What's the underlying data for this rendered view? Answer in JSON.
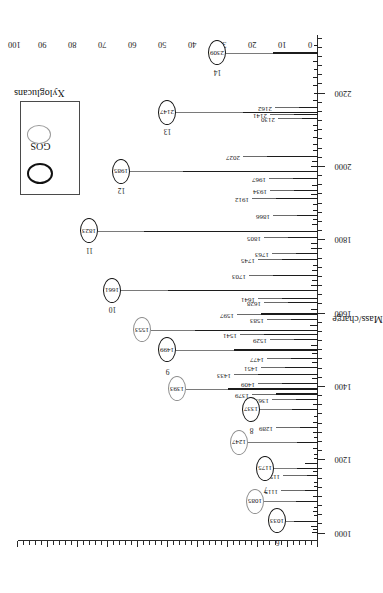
{
  "figure": {
    "orientation": "rotated-90",
    "background": "#ffffff"
  },
  "legend": {
    "position": "top-left",
    "items": [
      {
        "label": "GOS",
        "marker": "open-circle",
        "color": "#111111",
        "style": "thick-dark-ring"
      },
      {
        "label": "Xyloglucans",
        "marker": "open-circle",
        "color": "#9a9a9a",
        "style": "thin-grey-ring"
      }
    ]
  },
  "chart_data": {
    "type": "bar",
    "title": "",
    "subtitle": "",
    "xlabel": "Mass/charge",
    "ylabel": "",
    "xlim": [
      980,
      2360
    ],
    "ylim": [
      0,
      100
    ],
    "grid": false,
    "legend_position": "top-left",
    "xticks": [
      1000,
      1200,
      1400,
      1600,
      1800,
      2000,
      2200
    ],
    "xtick_labels": [
      "1000",
      "1200",
      "1400",
      "1600",
      "1800",
      "2000",
      "2200"
    ],
    "yticks": [
      0,
      10,
      20,
      30,
      40,
      50,
      60,
      70,
      80,
      90,
      100
    ],
    "ytick_labels": [
      "0",
      "10",
      "20",
      "30",
      "40",
      "50",
      "60",
      "70",
      "80",
      "90",
      "100"
    ],
    "x": [
      1001,
      1011,
      1019,
      1033,
      1047,
      1059,
      1071,
      1085,
      1099,
      1115,
      1127,
      1139,
      1157,
      1167,
      1175,
      1189,
      1203,
      1215,
      1231,
      1247,
      1261,
      1275,
      1289,
      1303,
      1319,
      1337,
      1351,
      1365,
      1379,
      1393,
      1409,
      1421,
      1433,
      1451,
      1465,
      1477,
      1489,
      1499,
      1513,
      1529,
      1541,
      1553,
      1565,
      1583,
      1597,
      1611,
      1628,
      1641,
      1661,
      1675,
      1689,
      1703,
      1717,
      1731,
      1745,
      1763,
      1777,
      1791,
      1805,
      1823,
      1841,
      1855,
      1866,
      1880,
      1896,
      1912,
      1924,
      1934,
      1948,
      1967,
      1985,
      2001,
      2013,
      2027,
      2043,
      2061,
      2079,
      2097,
      2113,
      2130,
      2141,
      2147,
      2162,
      2180,
      2199,
      2221,
      2243,
      2265,
      2287,
      2309,
      2331
    ],
    "values": [
      2.0,
      1.6,
      2.4,
      8.0,
      1.4,
      1.8,
      1.5,
      7.5,
      1.6,
      4.2,
      1.4,
      1.5,
      3.6,
      1.8,
      7.0,
      4.4,
      1.5,
      1.4,
      1.6,
      7.0,
      1.4,
      1.6,
      6.0,
      1.6,
      1.4,
      8.6,
      1.8,
      7.4,
      14.0,
      30.0,
      12.0,
      2.0,
      20.0,
      11.0,
      2.0,
      9.0,
      2.0,
      28.0,
      2.4,
      8.0,
      18.0,
      41.0,
      2.6,
      9.0,
      19.0,
      2.4,
      10.0,
      12.0,
      50.0,
      2.2,
      2.0,
      15.0,
      2.0,
      1.8,
      12.0,
      7.5,
      2.2,
      2.4,
      10.0,
      58.0,
      2.0,
      1.8,
      7.0,
      1.8,
      1.6,
      14.0,
      2.2,
      8.0,
      2.0,
      8.5,
      45.0,
      2.4,
      2.0,
      17.0,
      1.8,
      1.8,
      1.6,
      1.5,
      1.6,
      5.5,
      8.0,
      25.0,
      6.5,
      1.6,
      1.5,
      1.6,
      1.6,
      1.5,
      1.6,
      15.0,
      1.5
    ],
    "annotations_plain": [
      {
        "mz": 1115,
        "label": "1115"
      },
      {
        "mz": 1157,
        "label": "1157"
      },
      {
        "mz": 1289,
        "label": "1289"
      },
      {
        "mz": 1365,
        "label": "1365"
      },
      {
        "mz": 1379,
        "label": "1379"
      },
      {
        "mz": 1409,
        "label": "1409"
      },
      {
        "mz": 1433,
        "label": "1433"
      },
      {
        "mz": 1451,
        "label": "1451"
      },
      {
        "mz": 1477,
        "label": "1477"
      },
      {
        "mz": 1529,
        "label": "1529"
      },
      {
        "mz": 1541,
        "label": "1541"
      },
      {
        "mz": 1583,
        "label": "1583"
      },
      {
        "mz": 1597,
        "label": "1597"
      },
      {
        "mz": 1628,
        "label": "1628"
      },
      {
        "mz": 1641,
        "label": "1641"
      },
      {
        "mz": 1703,
        "label": "1703"
      },
      {
        "mz": 1745,
        "label": "1745"
      },
      {
        "mz": 1763,
        "label": "1763"
      },
      {
        "mz": 1805,
        "label": "1805"
      },
      {
        "mz": 1866,
        "label": "1866"
      },
      {
        "mz": 1912,
        "label": "1912"
      },
      {
        "mz": 1934,
        "label": "1934"
      },
      {
        "mz": 1967,
        "label": "1967"
      },
      {
        "mz": 2027,
        "label": "2027"
      },
      {
        "mz": 2130,
        "label": "2130"
      },
      {
        "mz": 2141,
        "label": "2141"
      },
      {
        "mz": 2162,
        "label": "2162"
      }
    ],
    "annotations_circled": [
      {
        "mz": 1033,
        "label": "1033",
        "number": "6",
        "series": "GOS"
      },
      {
        "mz": 1085,
        "label": "1085",
        "number": "",
        "series": "Xyloglucans"
      },
      {
        "mz": 1175,
        "label": "1175",
        "number": "7",
        "series": "GOS"
      },
      {
        "mz": 1247,
        "label": "1247",
        "number": "",
        "series": "Xyloglucans"
      },
      {
        "mz": 1337,
        "label": "1337",
        "number": "8",
        "series": "GOS"
      },
      {
        "mz": 1393,
        "label": "1393",
        "number": "",
        "series": "Xyloglucans"
      },
      {
        "mz": 1499,
        "label": "1499",
        "number": "9",
        "series": "GOS"
      },
      {
        "mz": 1553,
        "label": "1553",
        "number": "",
        "series": "Xyloglucans"
      },
      {
        "mz": 1661,
        "label": "1661",
        "number": "10",
        "series": "GOS"
      },
      {
        "mz": 1823,
        "label": "1823",
        "number": "11",
        "series": "GOS"
      },
      {
        "mz": 1985,
        "label": "1985",
        "number": "12",
        "series": "GOS"
      },
      {
        "mz": 2147,
        "label": "2147",
        "number": "13",
        "series": "GOS"
      },
      {
        "mz": 2309,
        "label": "2309",
        "number": "14",
        "series": "GOS"
      }
    ]
  }
}
